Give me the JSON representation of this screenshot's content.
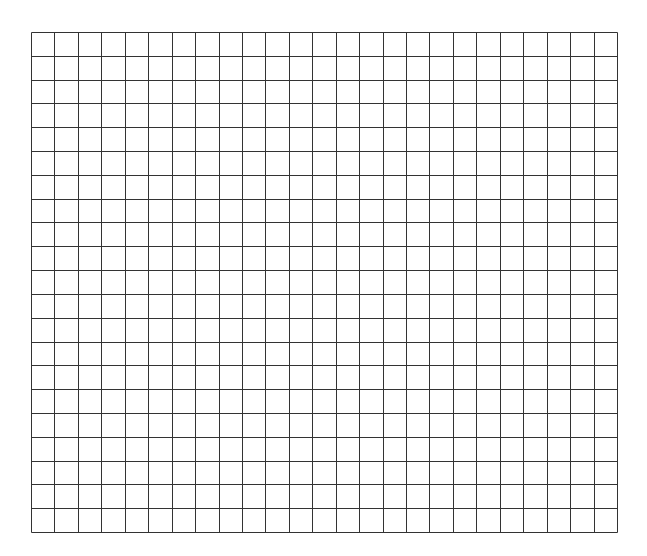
{
  "grid": {
    "x": 31,
    "y": 32,
    "width": 586,
    "height": 500,
    "columns": 25,
    "rows": 21,
    "line_color": "#333333",
    "line_width": 1,
    "background": "#ffffff"
  }
}
